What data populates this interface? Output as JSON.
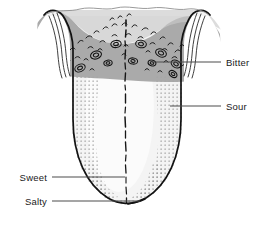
{
  "figure": {
    "title": "",
    "background_color": "#ffffff",
    "outline_color": "#1a1a1a",
    "bitter_band_color": "#a8a8a8",
    "dotted_zone_color": "#8c8c8c",
    "body_fill_color": "#f2f2f2",
    "center_fill_color": "#fafafa",
    "leader_line_color": "#4d4d4d",
    "label_text_color": "#1a1a1a"
  },
  "labels": [
    {
      "id": "bitter",
      "text": "Bitter",
      "side": "right",
      "text_x": 226,
      "text_y": 66,
      "leader_from_x": 152,
      "leader_from_y": 62,
      "leader_to_x": 221,
      "leader_to_y": 62,
      "region": "posterior-tongue-gray-band"
    },
    {
      "id": "sour",
      "text": "Sour",
      "side": "right",
      "text_x": 226,
      "text_y": 110,
      "leader_from_x": 170,
      "leader_from_y": 106,
      "leader_to_x": 221,
      "leader_to_y": 106,
      "region": "lateral-dotted-zone-right"
    },
    {
      "id": "sweet",
      "text": "Sweet",
      "side": "left",
      "text_x": 14,
      "text_y": 181,
      "leader_from_x": 52,
      "leader_from_y": 177,
      "leader_to_x": 125,
      "leader_to_y": 177,
      "region": "anterior-tip"
    },
    {
      "id": "salty",
      "text": "Salty",
      "side": "left",
      "text_x": 14,
      "text_y": 205,
      "leader_from_x": 52,
      "leader_from_y": 201,
      "leader_to_x": 140,
      "leader_to_y": 201,
      "region": "anterolateral-dotted-zone"
    }
  ],
  "anatomy": {
    "midline_name": "median-sulcus",
    "band_name": "sulcus-terminalis-band",
    "papillae_name": "circumvallate-papillae",
    "dots_name": "fungiform-papillae-stipple",
    "folds_name": "foliate-papillae-folds"
  }
}
